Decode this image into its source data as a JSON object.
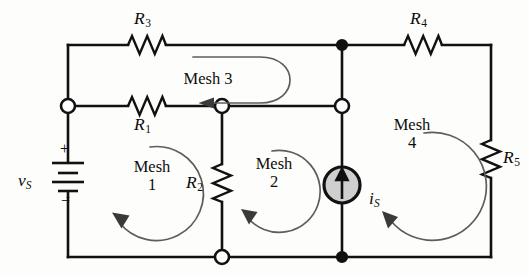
{
  "figure": {
    "kind": "circuit-schematic",
    "background_color": "#fdfdfb",
    "wire_color": "#111111",
    "mesh_arrow_color": "#5d5d5d",
    "source_fill_color": "#cfcfcf"
  },
  "components": {
    "r1": {
      "name": "R1",
      "base": "R",
      "sub": "1"
    },
    "r2": {
      "name": "R2",
      "base": "R",
      "sub": "2"
    },
    "r3": {
      "name": "R3",
      "base": "R",
      "sub": "3"
    },
    "r4": {
      "name": "R4",
      "base": "R",
      "sub": "4"
    },
    "r5": {
      "name": "R5",
      "base": "R",
      "sub": "5"
    },
    "vs": {
      "name": "vS",
      "base": "v",
      "sub": "S",
      "plus": "+",
      "minus": "−"
    },
    "is": {
      "name": "iS",
      "base": "i",
      "sub": "S"
    }
  },
  "meshes": [
    {
      "id": "mesh1",
      "label": "Mesh",
      "number": "1",
      "direction": "clockwise"
    },
    {
      "id": "mesh2",
      "label": "Mesh",
      "number": "2",
      "direction": "clockwise"
    },
    {
      "id": "mesh3",
      "label": "Mesh 3",
      "number": "",
      "direction": "clockwise"
    },
    {
      "id": "mesh4",
      "label": "Mesh",
      "number": "4",
      "direction": "clockwise"
    }
  ],
  "nodes": {
    "open_count": 4,
    "filled_count": 2
  }
}
